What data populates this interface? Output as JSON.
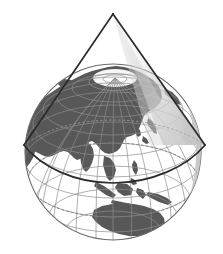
{
  "figure": {
    "title": "Conic projection tangent to a globe",
    "caption": "",
    "background_color": "#ffffff"
  },
  "colors": {
    "background": "#ffffff",
    "ocean": "#ffffff",
    "land": "#585858",
    "land_dark": "#4f4f4f",
    "graticule": "#8d8d8d",
    "graticule_light": "#b4b4b4",
    "globe_outline": "#6a6a6a",
    "cone_line": "#2b2b2b",
    "cone_shade": "#c9c9c9",
    "cone_shade_light": "#d8d8d8",
    "pole_fill": "#ffffff"
  },
  "globe": {
    "label": "globe",
    "center_x": 113,
    "center_y": 152,
    "radius": 88,
    "projection": "orthographic",
    "center_longitude": 110,
    "center_latitude": 22,
    "graticule_step_degrees": 15,
    "north_pole_visible": true,
    "north_pole_x": 115,
    "north_pole_y": 78
  },
  "cone": {
    "label": "projection cone",
    "apex_x": 113,
    "apex_y": 14,
    "left_vertex_x": 24,
    "left_vertex_y": 145,
    "right_vertex_x": 205,
    "right_vertex_y": 145,
    "base_mid_front_x": 113,
    "base_mid_front_y": 183,
    "base_mid_back_y": 120,
    "standard_parallel_degrees": 30,
    "line_width": 1.6,
    "shaded": true
  },
  "continents": [
    {
      "name": "eurasia",
      "label": "Eurasia"
    },
    {
      "name": "africa-edge",
      "label": "Africa (limb)"
    },
    {
      "name": "india",
      "label": "India"
    },
    {
      "name": "southeast-asia",
      "label": "Southeast Asia"
    },
    {
      "name": "japan",
      "label": "Japan"
    },
    {
      "name": "philippines",
      "label": "Philippines"
    },
    {
      "name": "indonesia",
      "label": "Indonesia"
    },
    {
      "name": "new-guinea",
      "label": "New Guinea"
    },
    {
      "name": "australia",
      "label": "Australia"
    },
    {
      "name": "greenland-limb",
      "label": "Greenland (limb)"
    },
    {
      "name": "alaska-limb",
      "label": "Alaska (limb)"
    }
  ],
  "annotations": []
}
